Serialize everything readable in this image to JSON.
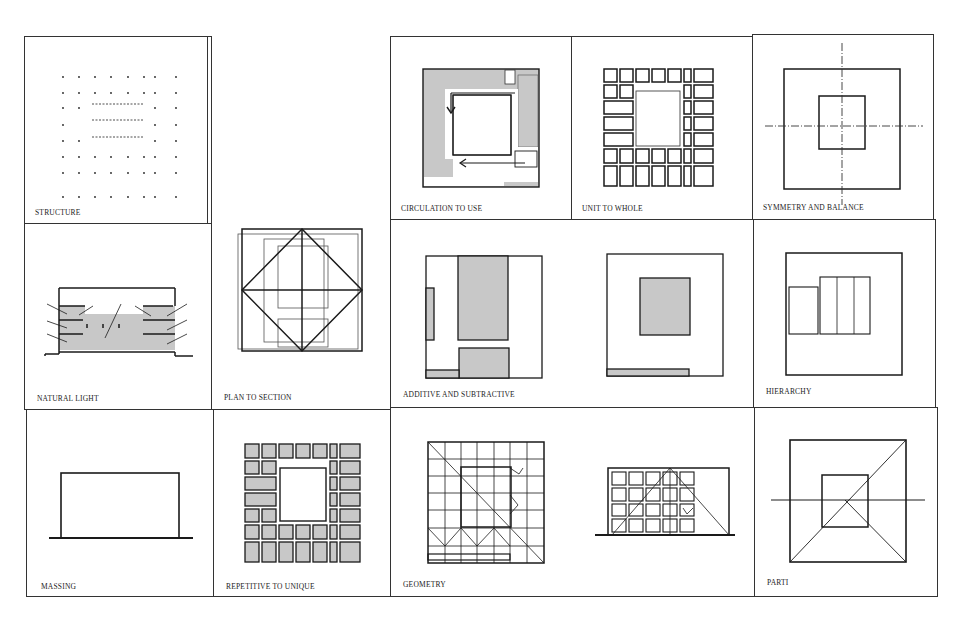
{
  "sheet": {
    "title_labels": {
      "structure": "STRUCTURE",
      "circulation": "CIRCULATION TO USE",
      "unit_to_whole": "UNIT TO WHOLE",
      "symmetry": "SYMMETRY AND BALANCE",
      "natural_light": "NATURAL LIGHT",
      "plan_to_section": "PLAN TO SECTION",
      "additive": "ADDITIVE AND SUBTRACTIVE",
      "hierarchy": "HIERARCHY",
      "massing": "MASSING",
      "repetitive": "REPETITIVE TO UNIQUE",
      "geometry": "GEOMETRY",
      "parti": "PARTI"
    },
    "colors": {
      "line": "#1a1a1a",
      "fill": "#c8c8c8",
      "border": "#333333"
    }
  }
}
